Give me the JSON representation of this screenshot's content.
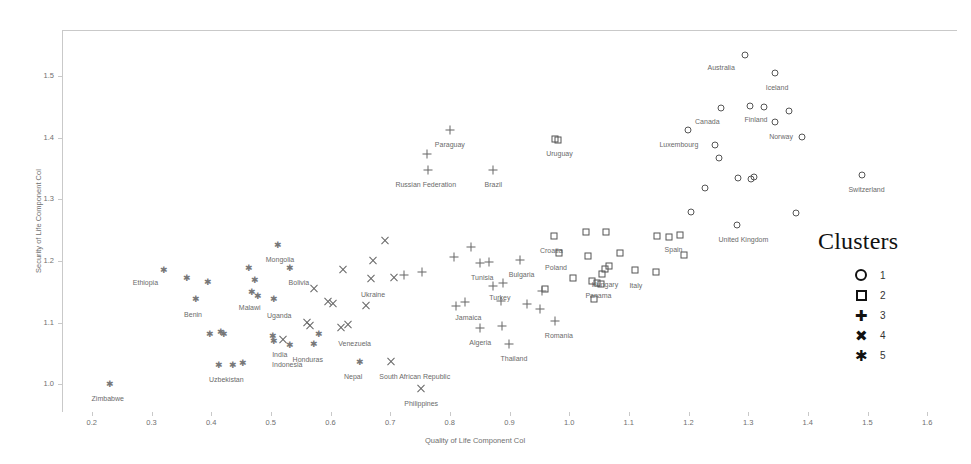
{
  "chart_data": {
    "type": "scatter",
    "title": "",
    "xlabel": "Quality of Life Component Col",
    "ylabel": "Security of Life Component Col",
    "xlim": [
      0.15,
      1.65
    ],
    "ylim": [
      0.955,
      1.575
    ],
    "xticks": [
      "0.2",
      "0.3",
      "0.4",
      "0.5",
      "0.6",
      "0.7",
      "0.8",
      "0.9",
      "1.0",
      "1.1",
      "1.2",
      "1.3",
      "1.4",
      "1.5",
      "1.6"
    ],
    "yticks": [
      "1.0",
      "1.1",
      "1.2",
      "1.3",
      "1.4",
      "1.5"
    ],
    "grid": false,
    "legend": {
      "title": "Clusters",
      "position": "right",
      "entries": [
        {
          "symbol": "circle",
          "label": "1"
        },
        {
          "symbol": "square",
          "label": "2"
        },
        {
          "symbol": "plus",
          "label": "3"
        },
        {
          "symbol": "cross",
          "label": "4"
        },
        {
          "symbol": "asterisk",
          "label": "5"
        }
      ]
    },
    "series": [
      {
        "name": "1",
        "symbol": "circle",
        "points": [
          {
            "x": 1.295,
            "y": 1.535,
            "label": "Australia",
            "lx": -24,
            "ly": 9
          },
          {
            "x": 1.345,
            "y": 1.505,
            "label": "Iceland",
            "lx": 2,
            "ly": 11
          },
          {
            "x": 1.255,
            "y": 1.448,
            "label": "Canada",
            "lx": -14,
            "ly": 10
          },
          {
            "x": 1.303,
            "y": 1.452,
            "label": "Finland",
            "lx": 6,
            "ly": 10
          },
          {
            "x": 1.327,
            "y": 1.45,
            "label": "",
            "lx": 0,
            "ly": 0
          },
          {
            "x": 1.368,
            "y": 1.443,
            "label": "",
            "lx": 0,
            "ly": 0
          },
          {
            "x": 1.345,
            "y": 1.425,
            "label": "Norway",
            "lx": 6,
            "ly": 11
          },
          {
            "x": 1.199,
            "y": 1.412,
            "label": "Luxembourg",
            "lx": -9,
            "ly": 11
          },
          {
            "x": 1.245,
            "y": 1.389,
            "label": "",
            "lx": 0,
            "ly": 0
          },
          {
            "x": 1.251,
            "y": 1.367,
            "label": "",
            "lx": 0,
            "ly": 0
          },
          {
            "x": 1.39,
            "y": 1.401,
            "label": "",
            "lx": 0,
            "ly": 0
          },
          {
            "x": 1.283,
            "y": 1.334,
            "label": "",
            "lx": 0,
            "ly": 0
          },
          {
            "x": 1.305,
            "y": 1.333,
            "label": "",
            "lx": 0,
            "ly": 0
          },
          {
            "x": 1.31,
            "y": 1.336,
            "label": "",
            "lx": 0,
            "ly": 0
          },
          {
            "x": 1.49,
            "y": 1.34,
            "label": "Switzerland",
            "lx": 5,
            "ly": 11
          },
          {
            "x": 1.228,
            "y": 1.318,
            "label": "",
            "lx": 0,
            "ly": 0
          },
          {
            "x": 1.205,
            "y": 1.28,
            "label": "",
            "lx": 0,
            "ly": 0
          },
          {
            "x": 1.282,
            "y": 1.258,
            "label": "United Kingdom",
            "lx": 6,
            "ly": 11
          },
          {
            "x": 1.38,
            "y": 1.278,
            "label": "",
            "lx": 0,
            "ly": 0
          }
        ]
      },
      {
        "name": "2",
        "symbol": "square",
        "points": [
          {
            "x": 0.977,
            "y": 1.398,
            "label": "Uruguay",
            "lx": 4,
            "ly": 11
          },
          {
            "x": 0.982,
            "y": 1.396,
            "label": "",
            "lx": 0,
            "ly": 0
          },
          {
            "x": 0.975,
            "y": 1.241,
            "label": "Croatia",
            "lx": -3,
            "ly": 11
          },
          {
            "x": 1.028,
            "y": 1.247,
            "label": "",
            "lx": 0,
            "ly": 0
          },
          {
            "x": 1.062,
            "y": 1.247,
            "label": "",
            "lx": 0,
            "ly": 0
          },
          {
            "x": 0.983,
            "y": 1.213,
            "label": "Poland",
            "lx": -3,
            "ly": 11
          },
          {
            "x": 1.032,
            "y": 1.209,
            "label": "",
            "lx": 0,
            "ly": 0
          },
          {
            "x": 1.085,
            "y": 1.213,
            "label": "",
            "lx": 0,
            "ly": 0
          },
          {
            "x": 1.06,
            "y": 1.187,
            "label": "Hungary",
            "lx": 0,
            "ly": 12
          },
          {
            "x": 1.066,
            "y": 1.192,
            "label": "",
            "lx": 0,
            "ly": 0
          },
          {
            "x": 1.055,
            "y": 1.179,
            "label": "",
            "lx": 0,
            "ly": 0
          },
          {
            "x": 1.11,
            "y": 1.185,
            "label": "Italy",
            "lx": 1,
            "ly": 12
          },
          {
            "x": 1.145,
            "y": 1.182,
            "label": "",
            "lx": 0,
            "ly": 0
          },
          {
            "x": 1.148,
            "y": 1.24,
            "label": "",
            "lx": 0,
            "ly": 0
          },
          {
            "x": 1.168,
            "y": 1.239,
            "label": "",
            "lx": 0,
            "ly": 0
          },
          {
            "x": 1.185,
            "y": 1.243,
            "label": "Spain",
            "lx": -6,
            "ly": 11
          },
          {
            "x": 1.192,
            "y": 1.21,
            "label": "",
            "lx": 0,
            "ly": 0
          },
          {
            "x": 1.007,
            "y": 1.172,
            "label": "",
            "lx": 0,
            "ly": 0
          },
          {
            "x": 1.039,
            "y": 1.167,
            "label": "Panama",
            "lx": 6,
            "ly": 11
          },
          {
            "x": 1.046,
            "y": 1.165,
            "label": "",
            "lx": 0,
            "ly": 0
          },
          {
            "x": 1.053,
            "y": 1.162,
            "label": "",
            "lx": 0,
            "ly": 0
          },
          {
            "x": 1.042,
            "y": 1.139,
            "label": "",
            "lx": 0,
            "ly": 0
          },
          {
            "x": 0.96,
            "y": 1.155,
            "label": "",
            "lx": 0,
            "ly": 0
          }
        ]
      },
      {
        "name": "3",
        "symbol": "plus",
        "points": [
          {
            "x": 0.8,
            "y": 1.413,
            "label": "Paraguay",
            "lx": 0,
            "ly": 11
          },
          {
            "x": 0.762,
            "y": 1.373,
            "label": "",
            "lx": 0,
            "ly": 0
          },
          {
            "x": 0.763,
            "y": 1.348,
            "label": "Russian Federation",
            "lx": -2,
            "ly": 11
          },
          {
            "x": 0.873,
            "y": 1.348,
            "label": "Brazil",
            "lx": 0,
            "ly": 11
          },
          {
            "x": 0.835,
            "y": 1.222,
            "label": "",
            "lx": 0,
            "ly": 0
          },
          {
            "x": 0.807,
            "y": 1.207,
            "label": "",
            "lx": 0,
            "ly": 0
          },
          {
            "x": 0.851,
            "y": 1.197,
            "label": "Tunisia",
            "lx": 2,
            "ly": 11
          },
          {
            "x": 0.866,
            "y": 1.198,
            "label": "",
            "lx": 0,
            "ly": 0
          },
          {
            "x": 0.917,
            "y": 1.202,
            "label": "Bulgaria",
            "lx": 2,
            "ly": 11
          },
          {
            "x": 0.754,
            "y": 1.183,
            "label": "",
            "lx": 0,
            "ly": 0
          },
          {
            "x": 0.723,
            "y": 1.178,
            "label": "",
            "lx": 0,
            "ly": 0
          },
          {
            "x": 0.872,
            "y": 1.159,
            "label": "",
            "lx": 0,
            "ly": 0
          },
          {
            "x": 0.889,
            "y": 1.165,
            "label": "Turkey",
            "lx": -3,
            "ly": 11
          },
          {
            "x": 0.954,
            "y": 1.152,
            "label": "",
            "lx": 0,
            "ly": 0
          },
          {
            "x": 0.81,
            "y": 1.127,
            "label": "",
            "lx": 0,
            "ly": 0
          },
          {
            "x": 0.826,
            "y": 1.133,
            "label": "Jamaica",
            "lx": 3,
            "ly": 12
          },
          {
            "x": 0.886,
            "y": 1.135,
            "label": "",
            "lx": 0,
            "ly": 0
          },
          {
            "x": 0.851,
            "y": 1.092,
            "label": "Algeria",
            "lx": 0,
            "ly": 11
          },
          {
            "x": 0.888,
            "y": 1.095,
            "label": "",
            "lx": 0,
            "ly": 0
          },
          {
            "x": 0.899,
            "y": 1.066,
            "label": "Thailand",
            "lx": 5,
            "ly": 11
          },
          {
            "x": 0.976,
            "y": 1.103,
            "label": "Romania",
            "lx": 4,
            "ly": 11
          },
          {
            "x": 0.951,
            "y": 1.122,
            "label": "",
            "lx": 0,
            "ly": 0
          },
          {
            "x": 0.93,
            "y": 1.13,
            "label": "",
            "lx": 0,
            "ly": 0
          }
        ]
      },
      {
        "name": "4",
        "symbol": "cross",
        "points": [
          {
            "x": 0.691,
            "y": 1.233,
            "label": "",
            "lx": 0,
            "ly": 0
          },
          {
            "x": 0.672,
            "y": 1.2,
            "label": "",
            "lx": 0,
            "ly": 0
          },
          {
            "x": 0.621,
            "y": 1.185,
            "label": "",
            "lx": 0,
            "ly": 0
          },
          {
            "x": 0.668,
            "y": 1.171,
            "label": "Ukraine",
            "lx": 2,
            "ly": 12
          },
          {
            "x": 0.706,
            "y": 1.173,
            "label": "",
            "lx": 0,
            "ly": 0
          },
          {
            "x": 0.572,
            "y": 1.155,
            "label": "",
            "lx": 0,
            "ly": 0
          },
          {
            "x": 0.596,
            "y": 1.133,
            "label": "",
            "lx": 0,
            "ly": 0
          },
          {
            "x": 0.604,
            "y": 1.131,
            "label": "",
            "lx": 0,
            "ly": 0
          },
          {
            "x": 0.66,
            "y": 1.127,
            "label": "",
            "lx": 0,
            "ly": 0
          },
          {
            "x": 0.56,
            "y": 1.099,
            "label": "",
            "lx": 0,
            "ly": 0
          },
          {
            "x": 0.566,
            "y": 1.094,
            "label": "",
            "lx": 0,
            "ly": 0
          },
          {
            "x": 0.63,
            "y": 1.097,
            "label": "",
            "lx": 0,
            "ly": 0
          },
          {
            "x": 0.617,
            "y": 1.091,
            "label": "Venezuela",
            "lx": 14,
            "ly": 12
          },
          {
            "x": 0.701,
            "y": 1.036,
            "label": "South African Republic",
            "lx": 24,
            "ly": 11
          },
          {
            "x": 0.752,
            "y": 0.993,
            "label": "Philippines",
            "lx": 0,
            "ly": 11
          },
          {
            "x": 0.52,
            "y": 1.072,
            "label": "India",
            "lx": -3,
            "ly": 11
          }
        ]
      },
      {
        "name": "5",
        "symbol": "asterisk",
        "points": [
          {
            "x": 0.23,
            "y": 1.0,
            "label": "Zimbabwe",
            "lx": -2,
            "ly": 11
          },
          {
            "x": 0.32,
            "y": 1.185,
            "label": "Ethiopia",
            "lx": -18,
            "ly": 9
          },
          {
            "x": 0.358,
            "y": 1.173,
            "label": "",
            "lx": 0,
            "ly": 0
          },
          {
            "x": 0.394,
            "y": 1.166,
            "label": "",
            "lx": 0,
            "ly": 0
          },
          {
            "x": 0.373,
            "y": 1.138,
            "label": "Benin",
            "lx": -2,
            "ly": 12
          },
          {
            "x": 0.463,
            "y": 1.189,
            "label": "",
            "lx": 0,
            "ly": 0
          },
          {
            "x": 0.512,
            "y": 1.226,
            "label": "Mongolia",
            "lx": 2,
            "ly": 11
          },
          {
            "x": 0.532,
            "y": 1.188,
            "label": "Bolivia",
            "lx": 9,
            "ly": 11
          },
          {
            "x": 0.472,
            "y": 1.17,
            "label": "",
            "lx": 0,
            "ly": 0
          },
          {
            "x": 0.468,
            "y": 1.15,
            "label": "Malawi",
            "lx": -2,
            "ly": 12
          },
          {
            "x": 0.478,
            "y": 1.143,
            "label": "",
            "lx": 0,
            "ly": 0
          },
          {
            "x": 0.504,
            "y": 1.138,
            "label": "Uganda",
            "lx": 6,
            "ly": 13
          },
          {
            "x": 0.397,
            "y": 1.081,
            "label": "",
            "lx": 0,
            "ly": 0
          },
          {
            "x": 0.416,
            "y": 1.085,
            "label": "",
            "lx": 0,
            "ly": 0
          },
          {
            "x": 0.42,
            "y": 1.081,
            "label": "",
            "lx": 0,
            "ly": 0
          },
          {
            "x": 0.502,
            "y": 1.079,
            "label": "",
            "lx": 0,
            "ly": 0
          },
          {
            "x": 0.504,
            "y": 1.07,
            "label": "Indonesia",
            "lx": 14,
            "ly": 20
          },
          {
            "x": 0.532,
            "y": 1.063,
            "label": "",
            "lx": 0,
            "ly": 0
          },
          {
            "x": 0.412,
            "y": 1.031,
            "label": "Uzbekistan",
            "lx": 8,
            "ly": 11
          },
          {
            "x": 0.436,
            "y": 1.032,
            "label": "",
            "lx": 0,
            "ly": 0
          },
          {
            "x": 0.452,
            "y": 1.034,
            "label": "",
            "lx": 0,
            "ly": 0
          },
          {
            "x": 0.572,
            "y": 1.066,
            "label": "Honduras",
            "lx": -6,
            "ly": 12
          },
          {
            "x": 0.58,
            "y": 1.082,
            "label": "",
            "lx": 0,
            "ly": 0
          },
          {
            "x": 0.648,
            "y": 1.036,
            "label": "Nepal",
            "lx": -6,
            "ly": 11
          }
        ]
      }
    ]
  }
}
